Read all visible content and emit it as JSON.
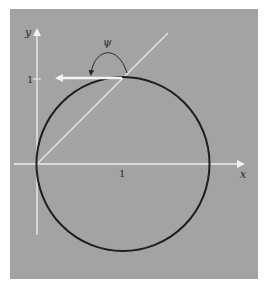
{
  "figure": {
    "background_color": "#a3a3a3",
    "axis_color": "#eeeeee",
    "circle_color": "#1e1e1e",
    "line_color": "#e8e8e8",
    "arc_color": "#2a2a2a"
  },
  "axes": {
    "x_label": "x",
    "y_label": "y",
    "x_tick_label": "1",
    "y_tick_label": "1"
  },
  "annotations": {
    "angle_label": "ψ"
  },
  "elements": {
    "circle": "circle of radius 1 centred at (1,0), passing through the origin",
    "diagonal_line": "line y = x from origin",
    "tangent_vector": "horizontal arrow pointing left at the top point (1,1)",
    "angle_arc": "arc marking angle ψ between line and arrow"
  }
}
